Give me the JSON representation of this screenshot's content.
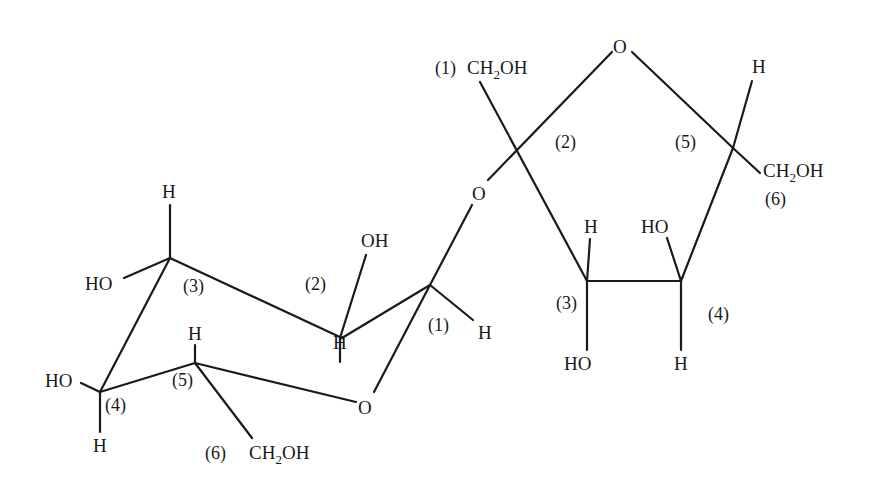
{
  "colors": {
    "ink": "#1a1a1a",
    "background": "#ffffff"
  },
  "labels": {
    "glucose": {
      "c3_h": "H",
      "c3_ho": "HO",
      "c3_num": "(3)",
      "c2_oh": "OH",
      "c2_num": "(2)",
      "c2_h": "H",
      "c1_num": "(1)",
      "c1_h": "H",
      "ring_o": "O",
      "c5_h": "H",
      "c5_num": "(5)",
      "c4_ho": "HO",
      "c4_num": "(4)",
      "c4_h": "H",
      "c6_num": "(6)",
      "c6_ch": "CH",
      "c6_sub": "2",
      "c6_oh": "OH"
    },
    "bridge_o": "O",
    "fructose": {
      "c1_num": "(1)",
      "c1_ch": "CH",
      "c1_sub": "2",
      "c1_oh": "OH",
      "c2_num": "(2)",
      "ring_o": "O",
      "c5_h": "H",
      "c5_num": "(5)",
      "c6_ch": "CH",
      "c6_sub": "2",
      "c6_oh": "OH",
      "c6_num": "(6)",
      "c3_h": "H",
      "c3_num": "(3)",
      "c3_ho": "HO",
      "c4_ho": "HO",
      "c4_num": "(4)",
      "c4_h": "H"
    }
  }
}
